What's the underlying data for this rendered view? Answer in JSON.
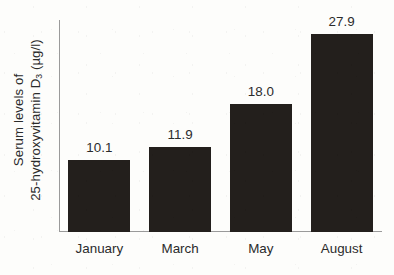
{
  "chart_data": {
    "type": "bar",
    "title": "",
    "subtitle": "",
    "xlabel": "",
    "ylabel": "Serum levels of 25-hydroxyvitamin D3 (µg/l)",
    "ylabel_lines": [
      {
        "text": "Serum levels of"
      },
      {
        "prefix": "25-hydroxyvitamin D",
        "subscript": "3",
        "suffix": " (µg/l)"
      }
    ],
    "categories": [
      "January",
      "March",
      "May",
      "August"
    ],
    "values": [
      10.1,
      11.9,
      18.0,
      27.9
    ],
    "value_labels": [
      "10.1",
      "11.9",
      "18.0",
      "27.9"
    ],
    "ylim": [
      0,
      29.8
    ],
    "grid": false,
    "legend": false,
    "legend_position": "none",
    "axis_ticks": false,
    "series": [
      {
        "name": "Serum 25-hydroxyvitamin D3",
        "values": [
          10.1,
          11.9,
          18.0,
          27.9
        ]
      }
    ]
  },
  "colors": {
    "background": "#fdfdfb",
    "bar": "#231f1c",
    "axis": "#9a9a9a",
    "text": "#2b2b2b"
  }
}
